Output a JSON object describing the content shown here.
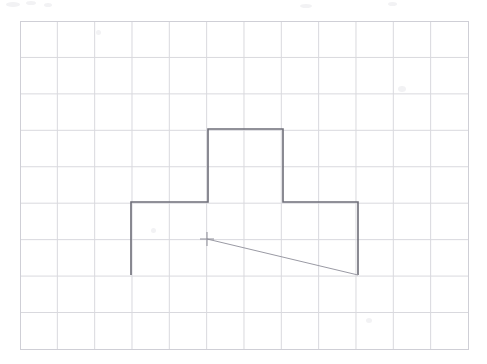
{
  "canvas": {
    "width": 487,
    "height": 364,
    "background_color": "#ffffff",
    "title": "Graph paper sketch of a T-shaped outline"
  },
  "grid": {
    "label": "graph-paper-grid",
    "origin_x": 20,
    "origin_y": 21,
    "cell_width": 37.33,
    "cell_height": 36.44,
    "columns": 12,
    "rows": 9,
    "right_x": 468,
    "bottom_y": 349,
    "line_color": "#d9d9de",
    "border_color": "#cfcfd6",
    "line_width": 1
  },
  "shape": {
    "name": "t-shape-outline",
    "stroke_color": "#6e6e78",
    "stroke_width": 1.6,
    "closed": false,
    "description": "Open T / plus-shaped polyline outline, missing the bottom edge",
    "points": [
      {
        "label": "bottom-left",
        "x": 131,
        "y": 275
      },
      {
        "label": "shoulder-left",
        "x": 131,
        "y": 202
      },
      {
        "label": "stem-left-base",
        "x": 208,
        "y": 202
      },
      {
        "label": "stem-top-left",
        "x": 208,
        "y": 129
      },
      {
        "label": "stem-top-right",
        "x": 283,
        "y": 129
      },
      {
        "label": "stem-right-base",
        "x": 283,
        "y": 202
      },
      {
        "label": "shoulder-right",
        "x": 358,
        "y": 202
      },
      {
        "label": "bottom-right",
        "x": 358,
        "y": 275
      }
    ]
  },
  "diagonal": {
    "name": "diagonal-construction-line",
    "stroke_color": "#9a9aa4",
    "stroke_width": 1,
    "x1": 207,
    "y1": 239,
    "x2": 358,
    "y2": 275
  },
  "crosshair": {
    "name": "crosshair-marker",
    "center_x": 207,
    "center_y": 239,
    "arm_length": 7,
    "stroke_color": "#8d8d97",
    "stroke_width": 1
  },
  "artifacts": [
    {
      "x": 6,
      "y": 2,
      "w": 14,
      "h": 5
    },
    {
      "x": 26,
      "y": 1,
      "w": 10,
      "h": 4
    },
    {
      "x": 44,
      "y": 3,
      "w": 8,
      "h": 4
    },
    {
      "x": 300,
      "y": 4,
      "w": 12,
      "h": 4
    },
    {
      "x": 388,
      "y": 2,
      "w": 9,
      "h": 4
    },
    {
      "x": 398,
      "y": 86,
      "w": 8,
      "h": 6
    },
    {
      "x": 96,
      "y": 30,
      "w": 5,
      "h": 5
    },
    {
      "x": 151,
      "y": 228,
      "w": 5,
      "h": 5
    },
    {
      "x": 366,
      "y": 318,
      "w": 6,
      "h": 5
    }
  ]
}
